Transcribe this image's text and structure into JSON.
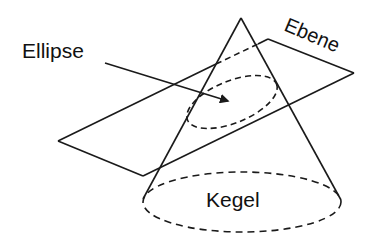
{
  "diagram": {
    "labels": {
      "ellipse": "Ellipse",
      "plane": "Ebene",
      "cone": "Kegel"
    },
    "colors": {
      "stroke": "#1a1a1a",
      "background": "#ffffff"
    },
    "geometry": {
      "cone_apex": [
        241,
        18
      ],
      "cone_base_center": [
        242,
        202
      ],
      "cone_base_radii": [
        99,
        30
      ],
      "plane_corners": [
        [
          58,
          141
        ],
        [
          268,
          39
        ],
        [
          354,
          73
        ],
        [
          143,
          176
        ]
      ],
      "section_ellipse_center": [
        232,
        102
      ],
      "section_ellipse_radii": [
        48,
        20
      ],
      "section_ellipse_rotation_deg": -22,
      "arrow_from": [
        105,
        63
      ],
      "arrow_to": [
        228,
        101
      ]
    }
  }
}
